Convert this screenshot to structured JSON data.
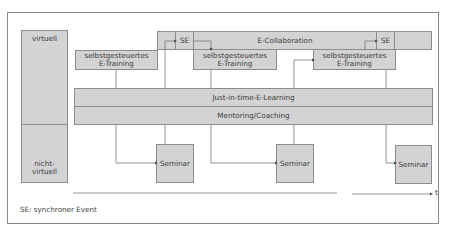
{
  "diagram": {
    "rows": {
      "virtual": "virtuell",
      "middle": "",
      "non_virtual": "nicht-\nvirtuell"
    },
    "top_band": {
      "label": "E-Collaboration",
      "se_1": "SE",
      "se_2": "SE"
    },
    "training_boxes": [
      {
        "line1": "selbstgesteuertes",
        "line2": "E-Training"
      },
      {
        "line1": "selbstgesteuertes",
        "line2": "E-Training"
      },
      {
        "line1": "selbstgesteuertes",
        "line2": "E-Training"
      }
    ],
    "bars": {
      "jit": "Just-in-time-E-Learning",
      "mentoring": "Mentoring/Coaching"
    },
    "seminars": [
      "Seminar",
      "Seminar",
      "Seminar"
    ],
    "time_axis_label": "t",
    "legend": "SE: synchroner Event"
  },
  "colors": {
    "box_fill": "#d3d3d3",
    "border": "#8c8c8c",
    "line": "#7a7a7a",
    "text": "#3c3c3c"
  }
}
